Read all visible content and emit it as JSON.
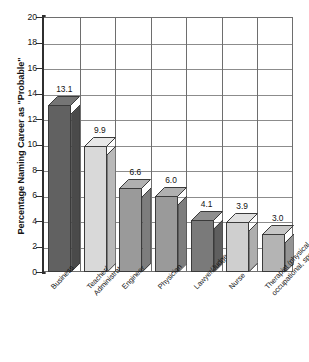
{
  "chart_data": {
    "type": "bar",
    "title": "",
    "subtitle": "",
    "xlabel": "",
    "ylabel": "Percentage Naming Career as \"Probable\"",
    "ylim": [
      0,
      20
    ],
    "yticks": [
      0,
      2,
      4,
      6,
      8,
      10,
      12,
      14,
      16,
      18,
      20
    ],
    "ytick_labels": [
      "0",
      "2",
      "4",
      "6",
      "8",
      "10",
      "12",
      "14",
      "16",
      "18",
      "20"
    ],
    "grid": "horizontal-and-vertical",
    "legend": "none",
    "three_d": true,
    "categories": [
      "Business",
      "Teacher/\nAdministrator",
      "Engineer",
      "Physician",
      "Lawyer/Judge",
      "Nurse",
      "Therapist (physical,\noccupational, speech)"
    ],
    "values": [
      13.1,
      9.9,
      6.6,
      6.0,
      4.1,
      3.9,
      3.0
    ],
    "value_labels": [
      "13.1",
      "9.9",
      "6.6",
      "6.0",
      "4.1",
      "3.9",
      "3.0"
    ],
    "bar_colors": [
      "#616161",
      "#d9d9d9",
      "#9a9a9a",
      "#9a9a9a",
      "#7a7a7a",
      "#cfcfcf",
      "#b4b4b4"
    ],
    "bar_side_colors": [
      "#4a4a4a",
      "#b9b9b9",
      "#7d7d7d",
      "#7d7d7d",
      "#5f5f5f",
      "#aeaeae",
      "#949494"
    ],
    "bar_top_colors": [
      "#757575",
      "#e8e8e8",
      "#b0b0b0",
      "#b0b0b0",
      "#8f8f8f",
      "#e0e0e0",
      "#c6c6c6"
    ]
  },
  "axis": {
    "tick_color": "#2f2f2f",
    "grid_color": "#8c8c8c",
    "frame_color": "#6e6e6e"
  }
}
